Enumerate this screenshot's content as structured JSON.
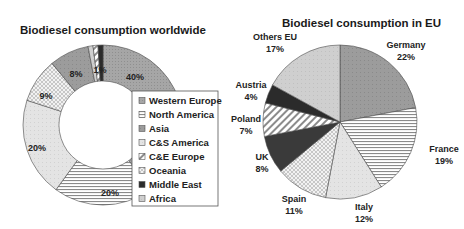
{
  "chart_data": [
    {
      "type": "pie",
      "variant": "donut",
      "title": "Biodiesel consumption worldwide",
      "legend_position": "right (overlapping)",
      "categories": [
        "Western Europe",
        "North America",
        "Asia",
        "C&S America",
        "C&E Europe",
        "Oceania",
        "Middle East",
        "Africa"
      ],
      "slices_clockwise_from_top": [
        {
          "name": "Western Europe",
          "value": 40,
          "label": "40%"
        },
        {
          "name": "North America",
          "value": 20,
          "label": "20%"
        },
        {
          "name": "C&S America",
          "value": 20,
          "label": "20%"
        },
        {
          "name": "Oceania",
          "value": 9,
          "label": "9%"
        },
        {
          "name": "Asia",
          "value": 8,
          "label": "8%"
        },
        {
          "name": "Africa",
          "value": 1,
          "label": ""
        },
        {
          "name": "C&E Europe",
          "value": 1,
          "label": "1%"
        },
        {
          "name": "Middle East",
          "value": 1,
          "label": ""
        }
      ]
    },
    {
      "type": "pie",
      "title": "Biodiesel consumption in EU",
      "slices_clockwise_from_top": [
        {
          "name": "Germany",
          "value": 22,
          "label": "22%"
        },
        {
          "name": "France",
          "value": 19,
          "label": "19%"
        },
        {
          "name": "Italy",
          "value": 12,
          "label": "12%"
        },
        {
          "name": "Spain",
          "value": 11,
          "label": "11%"
        },
        {
          "name": "UK",
          "value": 8,
          "label": "8%"
        },
        {
          "name": "Poland",
          "value": 7,
          "label": "7%"
        },
        {
          "name": "Austria",
          "value": 4,
          "label": "4%"
        },
        {
          "name": "Others EU",
          "value": 17,
          "label": "17%"
        }
      ]
    }
  ],
  "left": {
    "title": "Biodiesel consumption worldwide",
    "legend": [
      "Western Europe",
      "North America",
      "Asia",
      "C&S America",
      "C&E Europe",
      "Oceania",
      "Middle East",
      "Africa"
    ]
  },
  "right": {
    "title": "Biodiesel consumption in EU"
  }
}
